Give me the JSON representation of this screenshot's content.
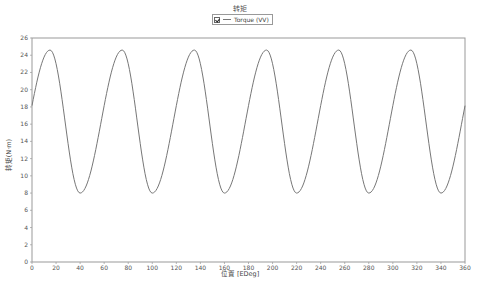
{
  "chart_data": {
    "type": "line",
    "title": "转矩",
    "xlabel": "位置 [EDeg]",
    "ylabel": "转矩(N·m)",
    "xlim": [
      0,
      360
    ],
    "ylim": [
      0,
      26
    ],
    "x_ticks": [
      0,
      20,
      40,
      60,
      80,
      100,
      120,
      140,
      160,
      180,
      200,
      220,
      240,
      260,
      280,
      300,
      320,
      340,
      360
    ],
    "y_ticks": [
      0,
      2,
      4,
      6,
      8,
      10,
      12,
      14,
      16,
      18,
      20,
      22,
      24,
      26
    ],
    "grid": false,
    "legend": {
      "position": "top-center",
      "entries": [
        "Torque (VV)"
      ]
    },
    "series": [
      {
        "name": "Torque (VV)",
        "color": "#777777",
        "model": {
          "period": 60,
          "peak_deg": 15,
          "min_offset": 25,
          "mean": 16.3,
          "amplitude": 8.3
        },
        "x": [
          0,
          10,
          20,
          30,
          40,
          50,
          60,
          70,
          80,
          90,
          100,
          110,
          120,
          130,
          140,
          150,
          160,
          170,
          180,
          190,
          200,
          210,
          220,
          230,
          240,
          250,
          260,
          270,
          280,
          290,
          300,
          310,
          320,
          330,
          340,
          350,
          360
        ],
        "values": [
          18.2,
          23.8,
          23.0,
          13.7,
          8.0,
          11.1,
          18.2,
          23.8,
          23.0,
          13.7,
          8.0,
          11.1,
          18.2,
          23.8,
          23.0,
          13.7,
          8.0,
          11.1,
          18.2,
          23.8,
          23.0,
          13.7,
          8.0,
          11.1,
          18.2,
          23.8,
          23.0,
          13.7,
          8.0,
          11.1,
          18.2,
          23.8,
          23.0,
          13.7,
          8.0,
          11.1,
          18.2
        ]
      }
    ],
    "peaks": {
      "value": 24.6,
      "at_deg": [
        15,
        75,
        135,
        195,
        255,
        315
      ]
    },
    "troughs": {
      "value": 8.0,
      "at_deg": [
        40,
        100,
        160,
        220,
        280,
        340
      ]
    }
  },
  "header": {
    "title": "转矩"
  },
  "legend": {
    "checked": true,
    "label": "Torque (VV)"
  },
  "axes": {
    "xlabel": "位置 [EDeg]",
    "ylabel": "转矩(N·m)"
  }
}
